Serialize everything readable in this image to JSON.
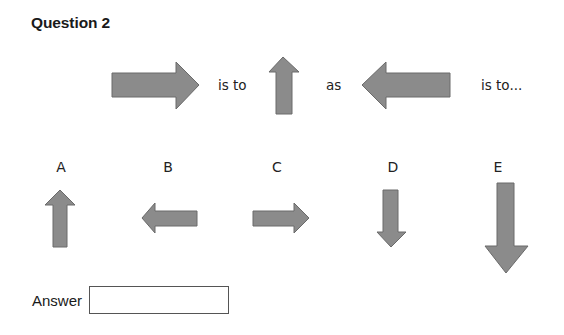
{
  "question": {
    "title": "Question 2",
    "stem": {
      "arrows": [
        {
          "id": "stem-1",
          "direction": "right"
        },
        {
          "id": "stem-2",
          "direction": "up"
        },
        {
          "id": "stem-3",
          "direction": "left"
        }
      ],
      "words": [
        "is to",
        "as",
        "is to..."
      ]
    },
    "options": [
      {
        "label": "A",
        "direction": "up",
        "size": "medium"
      },
      {
        "label": "B",
        "direction": "left",
        "size": "small"
      },
      {
        "label": "C",
        "direction": "right",
        "size": "small"
      },
      {
        "label": "D",
        "direction": "down",
        "size": "medium"
      },
      {
        "label": "E",
        "direction": "down",
        "size": "large"
      }
    ]
  },
  "answer": {
    "label": "Answer",
    "value": "",
    "placeholder": ""
  },
  "colors": {
    "arrow_fill": "#8b8b8b",
    "arrow_stroke": "#6a6a6a",
    "text": "#222222",
    "box_border": "#555555"
  }
}
